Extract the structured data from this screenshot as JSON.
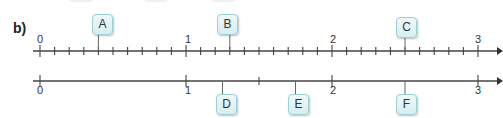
{
  "part_label": "b)",
  "top_line": {
    "major_labels": [
      "0",
      "1",
      "2",
      "3"
    ],
    "subdivisions_per_unit": 10,
    "markers": [
      {
        "label": "A",
        "value": 0.4
      },
      {
        "label": "B",
        "value": 1.3
      },
      {
        "label": "C",
        "value": 2.5
      }
    ]
  },
  "bottom_line": {
    "major_labels": [
      "0",
      "1",
      "2",
      "3"
    ],
    "minor_ticks": [
      1.5
    ],
    "markers": [
      {
        "label": "D",
        "value": 1.25
      },
      {
        "label": "E",
        "value": 1.75
      },
      {
        "label": "F",
        "value": 2.5
      }
    ]
  },
  "colors": {
    "box_border": "#9ccfd6",
    "box_fill": "#e3f3f5",
    "line": "#444444"
  }
}
